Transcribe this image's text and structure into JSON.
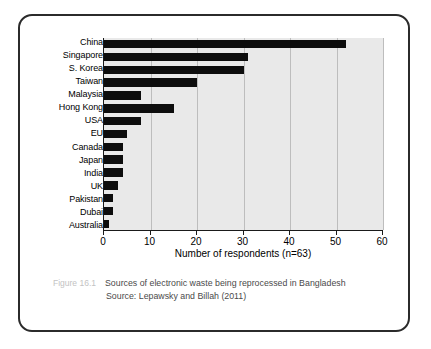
{
  "figure": {
    "number": "Figure 16.1",
    "title": "Sources of electronic waste being reprocessed in Bangladesh",
    "source": "Source: Lepawsky and Billah (2011)"
  },
  "chart_data": {
    "type": "bar",
    "orientation": "horizontal",
    "title": "",
    "xlabel": "Number of respondents (n=63)",
    "ylabel": "",
    "xlim": [
      0,
      60
    ],
    "xticks": [
      0,
      10,
      20,
      30,
      40,
      50,
      60
    ],
    "xtick_labels": [
      "0",
      "10",
      "20",
      "30",
      "40",
      "50",
      "60"
    ],
    "grid": "vertical",
    "legend": "none",
    "bar_color": "#0d0d0d",
    "plot_background": "#e9e9e9",
    "categories": [
      "China",
      "Singapore",
      "S. Korea",
      "Taiwan",
      "Malaysia",
      "Hong Kong",
      "USA",
      "EU",
      "Canada",
      "Japan",
      "India",
      "UK",
      "Pakistan",
      "Dubai",
      "Australia"
    ],
    "values": [
      52,
      31,
      30,
      20,
      8,
      15,
      8,
      5,
      4,
      4,
      4,
      3,
      2,
      2,
      1
    ]
  }
}
